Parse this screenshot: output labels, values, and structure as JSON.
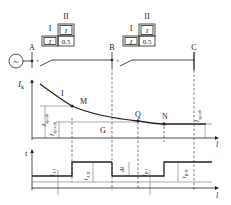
{
  "network": {
    "source_symbol": "~",
    "buses": [
      {
        "label": "A"
      },
      {
        "label": "B"
      },
      {
        "label": "C"
      }
    ],
    "relay_A": {
      "stage_I": {
        "label": "I",
        "setting": "I"
      },
      "stage_II": {
        "label": "II",
        "setting": "I",
        "time": "0.5"
      }
    },
    "relay_B": {
      "stage_I": {
        "label": "I",
        "setting": "I"
      },
      "stage_II": {
        "label": "II",
        "setting": "I",
        "time": "0.5"
      }
    }
  },
  "current_plot": {
    "y_axis_label": "I",
    "y_axis_sub": "k",
    "x_axis_label": "l",
    "curve_label": "I",
    "points": [
      {
        "label": "M"
      },
      {
        "label": "Q"
      },
      {
        "label": "N"
      },
      {
        "label": "G"
      }
    ],
    "setting_labels": {
      "op_A": {
        "main": "I",
        "sub": "op.qb"
      },
      "op_B": {
        "main": "I",
        "sub": "op.sqb"
      },
      "op_C": {
        "main": "I",
        "sub": "op.qb"
      }
    }
  },
  "time_plot": {
    "y_axis_label": "t",
    "x_axis_label": "l",
    "labels": {
      "tA1": {
        "main": "t",
        "sub": "A I"
      },
      "tA2": {
        "main": "t",
        "sub": "A II"
      },
      "dt": {
        "main": "Δt"
      },
      "tB1": {
        "main": "t",
        "sub": "B I"
      },
      "tB2": {
        "main": "t",
        "sub": "B II"
      }
    }
  }
}
